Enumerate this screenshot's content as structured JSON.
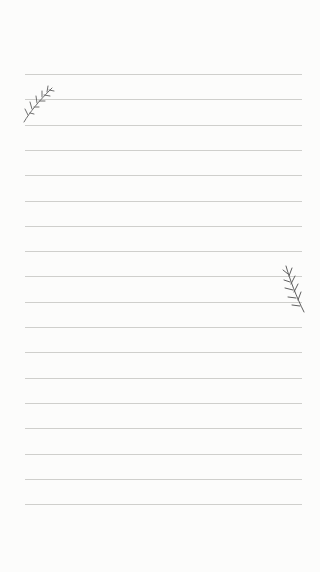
{
  "paper": {
    "background": "#fcfcfb",
    "line_color": "#cfcfcc",
    "line_count": 18,
    "first_line_y": 74,
    "line_spacing": 25.3
  },
  "decorations": [
    {
      "icon": "rosemary-sprig-icon",
      "position": "top-left"
    },
    {
      "icon": "rosemary-sprig-icon",
      "position": "middle-right"
    }
  ]
}
